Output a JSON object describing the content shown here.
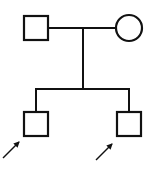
{
  "diagram": {
    "type": "pedigree-chart",
    "stroke_color": "#111111",
    "background": "#ffffff",
    "parents": {
      "father": {
        "shape": "square",
        "sex": "male",
        "affected": false
      },
      "mother": {
        "shape": "circle",
        "sex": "female",
        "affected": false
      }
    },
    "children": [
      {
        "shape": "square",
        "sex": "male",
        "affected": false,
        "proband_arrow": true
      },
      {
        "shape": "square",
        "sex": "male",
        "affected": false,
        "proband_arrow": true
      }
    ]
  }
}
